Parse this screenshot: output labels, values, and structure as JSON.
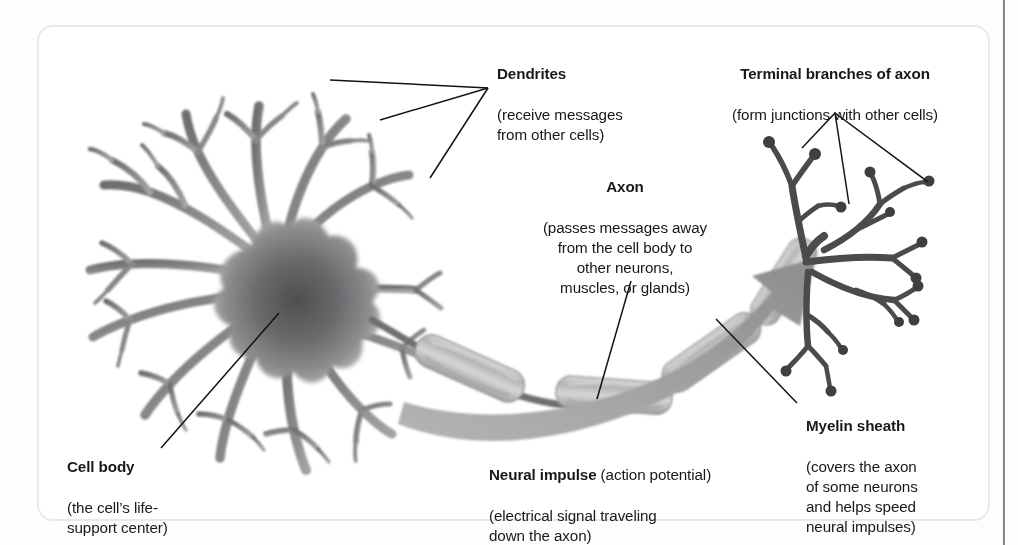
{
  "figure": {
    "name": "neuron-diagram",
    "background_color": "#ffffff",
    "card_border_color": "#e9e9e9",
    "ink_color": "#18181a",
    "neuron_gray": "#8d8d8f",
    "arrow_gray": "#9a9a9c"
  },
  "labels": {
    "dendrites": {
      "heading": "Dendrites",
      "body": "(receive messages\nfrom other cells)"
    },
    "terminal_branches": {
      "heading": "Terminal branches of axon",
      "body": "(form junctions with other cells)"
    },
    "axon": {
      "heading": "Axon",
      "body": "(passes messages away\nfrom the cell body to\nother neurons,\nmuscles, or glands)"
    },
    "myelin_sheath": {
      "heading": "Myelin sheath",
      "body": "(covers the axon\nof some neurons\nand helps speed\nneural impulses)"
    },
    "cell_body": {
      "heading": "Cell body",
      "body": "(the cell’s life-\nsupport center)"
    },
    "neural_impulse": {
      "heading": "Neural impulse",
      "heading_suffix": " (action potential)",
      "body": "(electrical signal traveling\ndown the axon)"
    }
  },
  "parts": [
    {
      "id": "dendrites",
      "label": "Dendrites"
    },
    {
      "id": "cell-body",
      "label": "Cell body"
    },
    {
      "id": "axon",
      "label": "Axon"
    },
    {
      "id": "myelin-sheath",
      "label": "Myelin sheath"
    },
    {
      "id": "neural-impulse",
      "label": "Neural impulse"
    },
    {
      "id": "terminal-branches",
      "label": "Terminal branches of axon"
    }
  ]
}
